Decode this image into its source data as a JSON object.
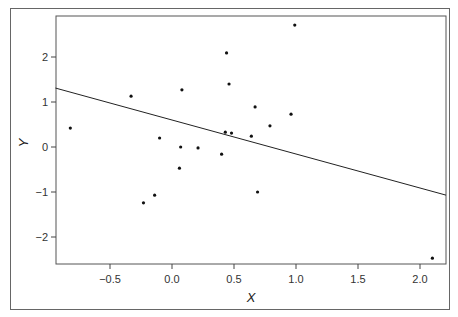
{
  "chart_data": {
    "type": "scatter",
    "title": "",
    "xlabel": "X",
    "ylabel": "Y",
    "xlim": [
      -0.94,
      2.21
    ],
    "ylim": [
      -2.6,
      2.9
    ],
    "x_ticks": [
      -0.5,
      0.0,
      0.5,
      1.0,
      1.5,
      2.0
    ],
    "x_tick_labels": [
      "−0.5",
      "0.0",
      "0.5",
      "1.0",
      "1.5",
      "2.0"
    ],
    "y_ticks": [
      -2,
      -1,
      0,
      1,
      2
    ],
    "y_tick_labels": [
      "−2",
      "−1",
      "0",
      "1",
      "2"
    ],
    "grid": false,
    "legend": "none",
    "points": [
      {
        "x": -0.82,
        "y": 0.42
      },
      {
        "x": -0.33,
        "y": 1.13
      },
      {
        "x": 0.08,
        "y": 1.27
      },
      {
        "x": 0.44,
        "y": 2.09
      },
      {
        "x": 0.46,
        "y": 1.4
      },
      {
        "x": 0.99,
        "y": 2.71
      },
      {
        "x": -0.1,
        "y": 0.2
      },
      {
        "x": 0.07,
        "y": 0.0
      },
      {
        "x": 0.21,
        "y": -0.02
      },
      {
        "x": 0.43,
        "y": 0.33
      },
      {
        "x": 0.48,
        "y": 0.31
      },
      {
        "x": 0.4,
        "y": -0.16
      },
      {
        "x": 0.67,
        "y": 0.89
      },
      {
        "x": 0.64,
        "y": 0.24
      },
      {
        "x": 0.79,
        "y": 0.47
      },
      {
        "x": 0.96,
        "y": 0.73
      },
      {
        "x": 0.69,
        "y": -1.0
      },
      {
        "x": 0.06,
        "y": -0.47
      },
      {
        "x": -0.14,
        "y": -1.07
      },
      {
        "x": -0.23,
        "y": -1.24
      },
      {
        "x": 2.1,
        "y": -2.47
      }
    ],
    "fit_line": {
      "x": [
        -0.94,
        2.21
      ],
      "y": [
        1.31,
        -1.07
      ]
    },
    "colors": {
      "points": "#111111",
      "line": "#222222",
      "axes": "#444444"
    }
  }
}
